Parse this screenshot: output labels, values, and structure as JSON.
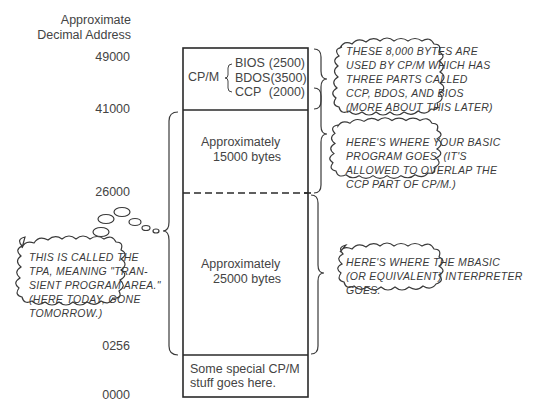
{
  "header": {
    "line1": "Approximate",
    "line2": "Decimal Address"
  },
  "addresses": [
    {
      "label": "49000"
    },
    {
      "label": "41000"
    },
    {
      "label": "26000"
    },
    {
      "label": "0256"
    },
    {
      "label": "0000"
    }
  ],
  "memory_map": {
    "cpm_block": {
      "label": "CP/M",
      "parts": [
        {
          "name": "BIOS",
          "size": "(2500)"
        },
        {
          "name": "BDOS",
          "size": "(3500)"
        },
        {
          "name": "CCP",
          "size": "(2000)"
        }
      ]
    },
    "basic_program_region": {
      "line1": "Approximately",
      "line2": "15000 bytes"
    },
    "interpreter_region": {
      "line1": "Approximately",
      "line2": "25000 bytes"
    },
    "low_region": {
      "line1": "Some special CP/M",
      "line2": "stuff goes here."
    }
  },
  "callouts": {
    "cpm": [
      "THESE 8,000 BYTES ARE",
      "USED BY CP/M WHICH HAS",
      "THREE PARTS CALLED",
      "CCP, BDOS, AND BIOS",
      "(MORE ABOUT THIS LATER)"
    ],
    "basic_program": [
      "HERE'S WHERE YOUR BASIC",
      "PROGRAM GOES. (IT'S",
      "ALLOWED TO OVERLAP THE",
      "CCP PART OF CP/M.)"
    ],
    "tpa": [
      "THIS IS CALLED THE",
      "TPA, MEANING \"TRAN-",
      "SIENT PROGRAM AREA.\"",
      "(HERE TODAY, GONE",
      "TOMORROW.)"
    ],
    "mbasic": [
      "HERE'S WHERE THE MBASIC",
      "(OR EQUIVALENT) INTERPRETER",
      "GOES."
    ]
  }
}
